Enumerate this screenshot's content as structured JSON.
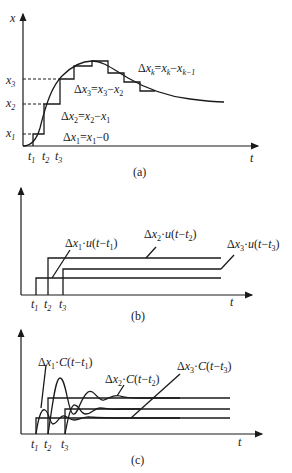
{
  "panel_a": {
    "caption": "(a)",
    "y_axis_label": "x",
    "x_axis_label": "t",
    "y_ticks": [
      "x3",
      "x2",
      "x1"
    ],
    "x_ticks": [
      "t1",
      "t2",
      "t3"
    ],
    "annotations": {
      "dk": "Δxk=xk−xk−1",
      "d3": "Δx3=x3−x2",
      "d2": "Δx2=x2−x1",
      "d1": "Δx1=x1−0"
    }
  },
  "panel_b": {
    "caption": "(b)",
    "x_axis_label": "t",
    "x_ticks": [
      "t1",
      "t2",
      "t3"
    ],
    "annotations": {
      "s1": "Δx1·u(t−t1)",
      "s2": "Δx2·u(t−t2)",
      "s3": "Δx3·u(t−t3)"
    }
  },
  "panel_c": {
    "caption": "(c)",
    "x_axis_label": "t",
    "x_ticks": [
      "t1",
      "t2",
      "t3"
    ],
    "annotations": {
      "c1": "Δx1·C(t−t1)",
      "c2": "Δx2·C(t−t2)",
      "c3": "Δx3·C(t−t3)"
    }
  }
}
